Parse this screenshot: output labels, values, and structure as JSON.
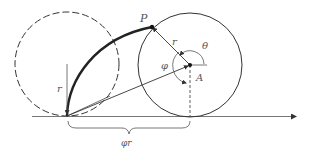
{
  "diagram": {
    "type": "cycloid-construction",
    "labels": {
      "point": "P",
      "center": "A",
      "radius_vertical": "r",
      "radius_to_p": "r",
      "angle_theta": "θ",
      "angle_phi": "φ",
      "arc_length": "φr"
    },
    "colors": {
      "stroke": "#333333",
      "curve": "#222222",
      "text": "#555555",
      "background": "#ffffff"
    }
  }
}
